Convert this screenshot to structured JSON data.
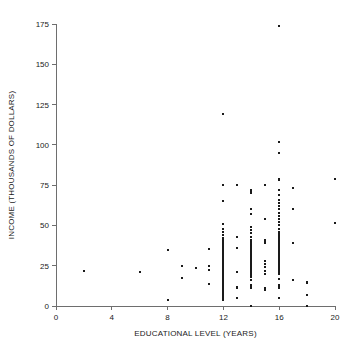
{
  "chart_data": {
    "type": "scatter",
    "title": "",
    "subtitle": "",
    "xlabel": "EDUCATIONAL LEVEL (YEARS)",
    "ylabel": "INCOME (THOUSANDS OF DOLLARS)",
    "xlim": [
      0,
      20
    ],
    "ylim": [
      0,
      175
    ],
    "xticks": [
      0,
      4,
      8,
      12,
      16,
      20
    ],
    "yticks": [
      0,
      25,
      50,
      75,
      100,
      125,
      150,
      175
    ],
    "xtick_labels": [
      "0",
      "4",
      "8",
      "12",
      "16",
      "20"
    ],
    "ytick_labels": [
      "0",
      "25",
      "50",
      "75",
      "100",
      "125",
      "150",
      "175"
    ],
    "grid": false,
    "legend": null,
    "marker_color": "#1a1a1a",
    "axis_color": "#6e6e6e",
    "marker_size_px": 2,
    "annotations": [],
    "points": [
      [
        2,
        22
      ],
      [
        6,
        21
      ],
      [
        8,
        35
      ],
      [
        8,
        4
      ],
      [
        9,
        25
      ],
      [
        9,
        17.5
      ],
      [
        10,
        23.5
      ],
      [
        11,
        35.5
      ],
      [
        11,
        25
      ],
      [
        11,
        22.5
      ],
      [
        11,
        13.5
      ],
      [
        12,
        119
      ],
      [
        12,
        75
      ],
      [
        12,
        65
      ],
      [
        12,
        51
      ],
      [
        12,
        48
      ],
      [
        12,
        46
      ],
      [
        12,
        44
      ],
      [
        12,
        42
      ],
      [
        12,
        41
      ],
      [
        12,
        40
      ],
      [
        12,
        39
      ],
      [
        12,
        38
      ],
      [
        12,
        37.5
      ],
      [
        12,
        37
      ],
      [
        12,
        36.5
      ],
      [
        12,
        36
      ],
      [
        12,
        35.5
      ],
      [
        12,
        35
      ],
      [
        12,
        34
      ],
      [
        12,
        33.5
      ],
      [
        12,
        33
      ],
      [
        12,
        32.5
      ],
      [
        12,
        32
      ],
      [
        12,
        31.5
      ],
      [
        12,
        31
      ],
      [
        12,
        30.5
      ],
      [
        12,
        30
      ],
      [
        12,
        29.5
      ],
      [
        12,
        29
      ],
      [
        12,
        28.5
      ],
      [
        12,
        28
      ],
      [
        12,
        27.5
      ],
      [
        12,
        27
      ],
      [
        12,
        26.5
      ],
      [
        12,
        26
      ],
      [
        12,
        25.5
      ],
      [
        12,
        25
      ],
      [
        12,
        24.5
      ],
      [
        12,
        24
      ],
      [
        12,
        23.5
      ],
      [
        12,
        23
      ],
      [
        12,
        22.5
      ],
      [
        12,
        22
      ],
      [
        12,
        21.5
      ],
      [
        12,
        21
      ],
      [
        12,
        20.5
      ],
      [
        12,
        20
      ],
      [
        12,
        19.5
      ],
      [
        12,
        19
      ],
      [
        12,
        18.5
      ],
      [
        12,
        18
      ],
      [
        12,
        17.5
      ],
      [
        12,
        17
      ],
      [
        12,
        16.5
      ],
      [
        12,
        16
      ],
      [
        12,
        15.5
      ],
      [
        12,
        15
      ],
      [
        12,
        14.5
      ],
      [
        12,
        14
      ],
      [
        12,
        13.5
      ],
      [
        12,
        13
      ],
      [
        12,
        12
      ],
      [
        12,
        11
      ],
      [
        12,
        10
      ],
      [
        12,
        9
      ],
      [
        12,
        8
      ],
      [
        12,
        7
      ],
      [
        12,
        6
      ],
      [
        12,
        5
      ],
      [
        12,
        4
      ],
      [
        13,
        75
      ],
      [
        13,
        43
      ],
      [
        13,
        36
      ],
      [
        13,
        21
      ],
      [
        13,
        12
      ],
      [
        13,
        11.5
      ],
      [
        13,
        11
      ],
      [
        13,
        5
      ],
      [
        14,
        72
      ],
      [
        14,
        71
      ],
      [
        14,
        70
      ],
      [
        14,
        60
      ],
      [
        14,
        57
      ],
      [
        14,
        49
      ],
      [
        14,
        47
      ],
      [
        14,
        45
      ],
      [
        14,
        43
      ],
      [
        14,
        41
      ],
      [
        14,
        40
      ],
      [
        14,
        39
      ],
      [
        14,
        38
      ],
      [
        14,
        37
      ],
      [
        14,
        36
      ],
      [
        14,
        35
      ],
      [
        14,
        34
      ],
      [
        14,
        33.5
      ],
      [
        14,
        33
      ],
      [
        14,
        32.5
      ],
      [
        14,
        32
      ],
      [
        14,
        31.5
      ],
      [
        14,
        31
      ],
      [
        14,
        30.5
      ],
      [
        14,
        30
      ],
      [
        14,
        29.5
      ],
      [
        14,
        29
      ],
      [
        14,
        28.5
      ],
      [
        14,
        28
      ],
      [
        14,
        27.5
      ],
      [
        14,
        27
      ],
      [
        14,
        26.5
      ],
      [
        14,
        26
      ],
      [
        14,
        25.5
      ],
      [
        14,
        25
      ],
      [
        14,
        24.5
      ],
      [
        14,
        24
      ],
      [
        14,
        23.5
      ],
      [
        14,
        23
      ],
      [
        14,
        22
      ],
      [
        14,
        21
      ],
      [
        14,
        20
      ],
      [
        14,
        19
      ],
      [
        14,
        18
      ],
      [
        14,
        16
      ],
      [
        14,
        13
      ],
      [
        14,
        12
      ],
      [
        14,
        11
      ],
      [
        14,
        0
      ],
      [
        15,
        75
      ],
      [
        15,
        54
      ],
      [
        15,
        41
      ],
      [
        15,
        40
      ],
      [
        15,
        39
      ],
      [
        15,
        28
      ],
      [
        15,
        26
      ],
      [
        15,
        24
      ],
      [
        15,
        22
      ],
      [
        15,
        20
      ],
      [
        15,
        11
      ],
      [
        15,
        10
      ],
      [
        16,
        174
      ],
      [
        16,
        102
      ],
      [
        16,
        95
      ],
      [
        16,
        79
      ],
      [
        16,
        78
      ],
      [
        16,
        72
      ],
      [
        16,
        69
      ],
      [
        16,
        66
      ],
      [
        16,
        64
      ],
      [
        16,
        62
      ],
      [
        16,
        60
      ],
      [
        16,
        58
      ],
      [
        16,
        56
      ],
      [
        16,
        54
      ],
      [
        16,
        52
      ],
      [
        16,
        50
      ],
      [
        16,
        48
      ],
      [
        16,
        46
      ],
      [
        16,
        45
      ],
      [
        16,
        44
      ],
      [
        16,
        43
      ],
      [
        16,
        42
      ],
      [
        16,
        41
      ],
      [
        16,
        40
      ],
      [
        16,
        39
      ],
      [
        16,
        38
      ],
      [
        16,
        37.5
      ],
      [
        16,
        37
      ],
      [
        16,
        36.5
      ],
      [
        16,
        36
      ],
      [
        16,
        35.5
      ],
      [
        16,
        35
      ],
      [
        16,
        34.5
      ],
      [
        16,
        34
      ],
      [
        16,
        33.5
      ],
      [
        16,
        33
      ],
      [
        16,
        32.5
      ],
      [
        16,
        32
      ],
      [
        16,
        31.5
      ],
      [
        16,
        31
      ],
      [
        16,
        30.5
      ],
      [
        16,
        30
      ],
      [
        16,
        29
      ],
      [
        16,
        28
      ],
      [
        16,
        27
      ],
      [
        16,
        26
      ],
      [
        16,
        25
      ],
      [
        16,
        24
      ],
      [
        16,
        23
      ],
      [
        16,
        22
      ],
      [
        16,
        21
      ],
      [
        16,
        20
      ],
      [
        16,
        17
      ],
      [
        16,
        13
      ],
      [
        16,
        12
      ],
      [
        16,
        11
      ],
      [
        16,
        5
      ],
      [
        17,
        73
      ],
      [
        17,
        60
      ],
      [
        17,
        39
      ],
      [
        17,
        16
      ],
      [
        18,
        15
      ],
      [
        18,
        14
      ],
      [
        18,
        7
      ],
      [
        18,
        0
      ],
      [
        20,
        79
      ],
      [
        20,
        51.5
      ]
    ]
  },
  "plot": {
    "xlabel": "EDUCATIONAL LEVEL (YEARS)",
    "ylabel": "INCOME (THOUSANDS OF DOLLARS)"
  }
}
